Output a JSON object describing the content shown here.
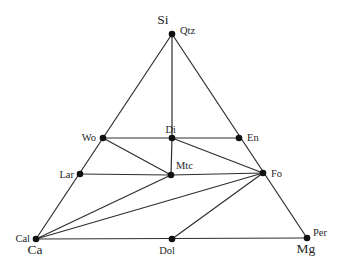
{
  "diagram": {
    "type": "ternary-phase-diagram",
    "canvas": {
      "width": 344,
      "height": 270
    },
    "colors": {
      "background": "#ffffff",
      "line": "#2e2e2e",
      "dot": "#111111",
      "text": "#1f1f1f"
    },
    "style": {
      "line_width": 1.2,
      "dot_radius": 3.3
    },
    "corner_labels": [
      {
        "id": "si",
        "label": "Si",
        "x": 163,
        "y": 24,
        "anchor": "middle"
      },
      {
        "id": "ca",
        "label": "Ca",
        "x": 35,
        "y": 254,
        "anchor": "middle"
      },
      {
        "id": "mg",
        "label": "Mg",
        "x": 306,
        "y": 253,
        "anchor": "middle"
      }
    ],
    "nodes": [
      {
        "id": "qtz",
        "label": "Qtz",
        "x": 172,
        "y": 34,
        "lx": 180,
        "ly": 34,
        "anchor": "start"
      },
      {
        "id": "wo",
        "label": "Wo",
        "x": 103,
        "y": 138,
        "lx": 96,
        "ly": 141,
        "anchor": "end"
      },
      {
        "id": "di",
        "label": "Di",
        "x": 172,
        "y": 138,
        "lx": 176,
        "ly": 133,
        "anchor": "end"
      },
      {
        "id": "en",
        "label": "En",
        "x": 239,
        "y": 138,
        "lx": 247,
        "ly": 141,
        "anchor": "start"
      },
      {
        "id": "lar",
        "label": "Lar",
        "x": 80,
        "y": 174,
        "lx": 74,
        "ly": 178,
        "anchor": "end"
      },
      {
        "id": "mtc",
        "label": "Mtc",
        "x": 171,
        "y": 175,
        "lx": 176,
        "ly": 169,
        "anchor": "start"
      },
      {
        "id": "fo",
        "label": "Fo",
        "x": 263,
        "y": 173,
        "lx": 271,
        "ly": 177,
        "anchor": "start"
      },
      {
        "id": "cal",
        "label": "Cal",
        "x": 36,
        "y": 239,
        "lx": 30,
        "ly": 242,
        "anchor": "end"
      },
      {
        "id": "dol",
        "label": "Dol",
        "x": 172,
        "y": 239,
        "lx": 167,
        "ly": 254,
        "anchor": "middle"
      },
      {
        "id": "per",
        "label": "Per",
        "x": 307,
        "y": 238,
        "lx": 313,
        "ly": 236,
        "anchor": "start"
      }
    ],
    "edges": [
      [
        "qtz",
        "cal"
      ],
      [
        "qtz",
        "per"
      ],
      [
        "cal",
        "per"
      ],
      [
        "qtz",
        "di"
      ],
      [
        "di",
        "mtc"
      ],
      [
        "wo",
        "en"
      ],
      [
        "lar",
        "mtc"
      ],
      [
        "mtc",
        "fo"
      ],
      [
        "wo",
        "mtc"
      ],
      [
        "di",
        "fo"
      ],
      [
        "cal",
        "mtc"
      ],
      [
        "cal",
        "fo"
      ],
      [
        "dol",
        "fo"
      ]
    ]
  }
}
